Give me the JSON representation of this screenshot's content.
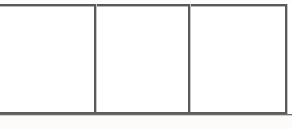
{
  "document": {
    "kind": "scanned-table-fragment",
    "page_background": "#fefefe",
    "ink_color": "#5a5a5a"
  },
  "table": {
    "row_count": 1,
    "column_count": 3,
    "cropped_left_edge": true,
    "columns": [
      {
        "name": "column-1",
        "text": ""
      },
      {
        "name": "column-2",
        "text": ""
      },
      {
        "name": "column-3",
        "text": ""
      }
    ],
    "rules": {
      "top": "",
      "bottom": "",
      "baseline": "",
      "divider_1": "",
      "divider_2": "",
      "right_border": ""
    }
  }
}
